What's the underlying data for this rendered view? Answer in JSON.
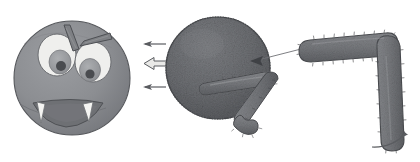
{
  "illustration": {
    "title": "Monster craft assembly steps",
    "description": "Grayscale craft instruction illustration: finished monster head, textured body ball with attachment arrows, and a furry bent arm",
    "background_color": "#ffffff",
    "width": 420,
    "height": 162
  },
  "palette": {
    "head_fill": "#8f9195",
    "head_shade": "#7b7d82",
    "head_outline": "#55575b",
    "eye_white": "#efefed",
    "eye_white_outline": "#6a6c70",
    "iris": "#9a9c9f",
    "pupil": "#4a4c50",
    "brow": "#7a7c80",
    "brow_outline": "#4e5054",
    "mouth": "#6e7074",
    "fang": "#f4f4f2",
    "ball_fill": "#6e7074",
    "ball_shade": "#5c5e62",
    "ball_outline": "#45474b",
    "fur_fill": "#7a7c80",
    "fur_shade": "#63656a",
    "fur_outline": "#4c4e52",
    "arrow": "#5a5c60",
    "leader_line": "#6f7175",
    "highlight": "#b9bbbe"
  },
  "parts": [
    {
      "id": "monster-head",
      "label": "Finished monster head",
      "shape": "sphere-face",
      "cx": 72,
      "cy": 78,
      "radius": 58,
      "features": [
        "left-eye",
        "right-eye",
        "left-eyebrow",
        "right-eyebrow",
        "mouth",
        "left-fang",
        "right-fang"
      ]
    },
    {
      "id": "body-ball",
      "label": "Textured body ball",
      "shape": "textured-sphere",
      "cx": 218,
      "cy": 68,
      "radius": 52,
      "texture": "rough-grain"
    },
    {
      "id": "small-leg",
      "label": "Furry zigzag leg",
      "shape": "bent-furry-limb",
      "segments": 3,
      "attached_to": "body-ball"
    },
    {
      "id": "big-arm",
      "label": "Large furry bent arm",
      "shape": "L-shaped-furry-limb",
      "segments": 2,
      "attached_to": "body-ball"
    }
  ],
  "eyes": {
    "left": {
      "cx": 57,
      "cy": 55,
      "rx": 18,
      "ry": 21,
      "pupil_cx": 60,
      "pupil_cy": 62
    },
    "right": {
      "cx": 92,
      "cy": 62,
      "rx": 17,
      "ry": 20,
      "pupil_cx": 89,
      "pupil_cy": 70
    }
  },
  "arrows": [
    {
      "id": "arrow-upper-left",
      "direction": "left",
      "style": "thin",
      "x": 152,
      "y": 44,
      "note": "points from ball toward head"
    },
    {
      "id": "arrow-center-left",
      "direction": "left",
      "style": "thick-outline",
      "x": 146,
      "y": 64,
      "note": "main attachment direction"
    },
    {
      "id": "arrow-lower-left",
      "direction": "left",
      "style": "thin",
      "x": 152,
      "y": 87,
      "note": "points from ball toward head"
    },
    {
      "id": "arrow-ball-attach",
      "direction": "left",
      "style": "solid-head",
      "x": 252,
      "y": 61,
      "note": "arm attaches to ball here"
    },
    {
      "id": "arrow-curved-up-right",
      "direction": "up-right",
      "style": "curved",
      "x": 392,
      "y": 138,
      "note": "bend / rotate the arm"
    }
  ],
  "leader_lines": [
    {
      "id": "arm-to-ball-leader",
      "from": [
        301,
        49
      ],
      "to": [
        254,
        61
      ]
    }
  ]
}
